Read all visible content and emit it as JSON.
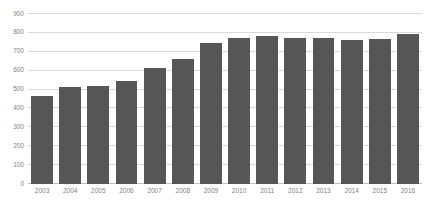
{
  "chart_data": {
    "type": "bar",
    "title": "",
    "subtitle": "",
    "xlabel": "",
    "ylabel": "",
    "categories": [
      "2003",
      "2004",
      "2005",
      "2006",
      "2007",
      "2008",
      "2009",
      "2010",
      "2011",
      "2012",
      "2013",
      "2014",
      "2015",
      "2016"
    ],
    "values": [
      465,
      515,
      518,
      545,
      615,
      660,
      745,
      775,
      785,
      775,
      772,
      760,
      768,
      795
    ],
    "series": [
      {
        "name": "",
        "values": [
          465,
          515,
          518,
          545,
          615,
          660,
          745,
          775,
          785,
          775,
          772,
          760,
          768,
          795
        ]
      }
    ],
    "ylim": [
      0,
      900
    ],
    "ytick_labels": [
      "900",
      "800",
      "700",
      "600",
      "500",
      "400",
      "300",
      "200",
      "100",
      "0"
    ],
    "ytick_values": [
      900,
      800,
      700,
      600,
      500,
      400,
      300,
      200,
      100,
      0
    ],
    "ytick_step": 100,
    "grid": true,
    "grid_axis": "y",
    "legend": false,
    "legend_position": "none",
    "bar_color": "#565656",
    "gridline_color": "#d9d9d9",
    "axis_color": "#bfbfbf",
    "tick_label_color": "#7f7f7f",
    "background_color": "#ffffff",
    "annotations": []
  }
}
